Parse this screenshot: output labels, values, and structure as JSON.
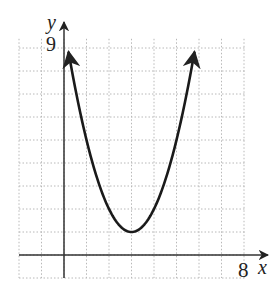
{
  "chart_data": {
    "type": "line",
    "title": "",
    "xlabel": "x",
    "ylabel": "y",
    "x_tick_labels": [
      "8"
    ],
    "y_tick_labels": [
      "9"
    ],
    "xlim": [
      -2,
      8.5
    ],
    "ylim": [
      -1,
      9.5
    ],
    "grid": true,
    "grid_step": 1,
    "series": [
      {
        "name": "parabola",
        "equation": "y = (x - 3)^2 + 1",
        "vertex": [
          3,
          1
        ],
        "x": [
          0.2,
          1,
          2,
          3,
          4,
          5,
          5.8
        ],
        "y": [
          8.84,
          5,
          2,
          1,
          2,
          5,
          8.84
        ],
        "arrows_both_ends": true
      }
    ]
  },
  "labels": {
    "y_axis": "y",
    "x_axis": "x",
    "y_tick": "9",
    "x_tick": "8"
  }
}
